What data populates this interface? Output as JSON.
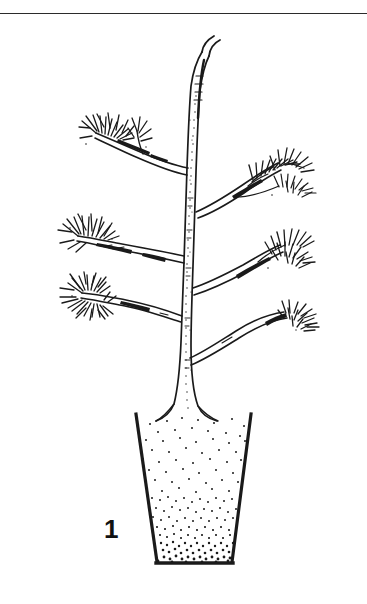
{
  "figure": {
    "number_label": "1",
    "caption_text": "",
    "style": "black and white pen-and-ink line drawing",
    "background_color": "#ffffff",
    "ink_color": "#1a1a1a"
  },
  "divider": {
    "name": "top-horizontal-rule",
    "color": "#2b2b2b",
    "y": 13,
    "thickness": 1
  },
  "plant": {
    "type": "sapling",
    "leader_label": "central leader",
    "leader": {
      "tip_x": 208,
      "tip_y": 48,
      "base_x": 186,
      "base_y": 420,
      "tip_curves": "right"
    },
    "trunk_texture": "stippled dotted shading along centerline",
    "branch_count": 5,
    "branches": [
      {
        "id": "upper-left",
        "side": "left",
        "origin_x": 183,
        "origin_y": 166,
        "tip_x": 78,
        "tip_y": 120,
        "foliage": "needle tuft",
        "has_secondary_twig": true
      },
      {
        "id": "upper-right",
        "side": "right",
        "origin_x": 196,
        "origin_y": 210,
        "tip_x": 300,
        "tip_y": 148,
        "foliage": "needle tuft",
        "has_secondary_twig": true
      },
      {
        "id": "middle-left",
        "side": "left",
        "origin_x": 181,
        "origin_y": 250,
        "tip_x": 62,
        "tip_y": 210,
        "foliage": "needle tuft",
        "has_secondary_twig": false
      },
      {
        "id": "middle-right",
        "side": "right",
        "origin_x": 194,
        "origin_y": 283,
        "tip_x": 298,
        "tip_y": 228,
        "foliage": "needle tuft",
        "has_secondary_twig": true
      },
      {
        "id": "lower-left",
        "side": "left",
        "origin_x": 180,
        "origin_y": 305,
        "tip_x": 58,
        "tip_y": 285,
        "foliage": "dense double needle tuft",
        "has_secondary_twig": false
      },
      {
        "id": "lower-right",
        "side": "right",
        "origin_x": 192,
        "origin_y": 352,
        "tip_x": 300,
        "tip_y": 312,
        "foliage": "needle tuft",
        "has_secondary_twig": false
      }
    ]
  },
  "container": {
    "name": "planting pot",
    "shape": "tapered trapezoid, open top, narrower base",
    "top_left_x": 136,
    "top_right_x": 251,
    "top_y": 414,
    "bottom_left_x": 157,
    "bottom_right_x": 232,
    "bottom_y": 563,
    "wall_color": "#1a1a1a",
    "fill": {
      "name": "soil",
      "render": "stipple dots, density increasing toward base",
      "dot_color": "#1a1a1a"
    }
  }
}
